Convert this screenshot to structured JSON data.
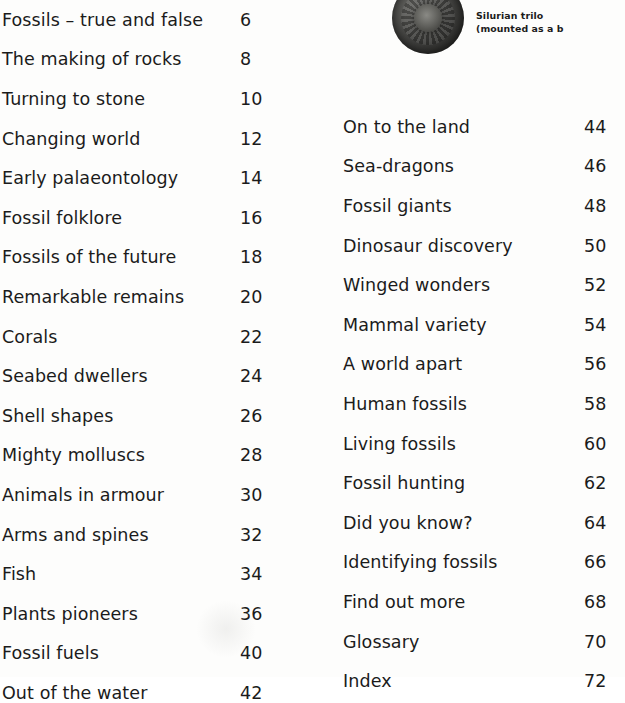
{
  "document": {
    "type": "table-of-contents"
  },
  "left_column": [
    {
      "title": "Fossils – true and false",
      "page": "6"
    },
    {
      "title": "The making of rocks",
      "page": "8"
    },
    {
      "title": "Turning to stone",
      "page": "10"
    },
    {
      "title": "Changing world",
      "page": "12"
    },
    {
      "title": "Early palaeontology",
      "page": "14"
    },
    {
      "title": "Fossil folklore",
      "page": "16"
    },
    {
      "title": "Fossils of the future",
      "page": "18"
    },
    {
      "title": "Remarkable remains",
      "page": "20"
    },
    {
      "title": "Corals",
      "page": "22"
    },
    {
      "title": "Seabed dwellers",
      "page": "24"
    },
    {
      "title": "Shell shapes",
      "page": "26"
    },
    {
      "title": "Mighty molluscs",
      "page": "28"
    },
    {
      "title": "Animals in armour",
      "page": "30"
    },
    {
      "title": "Arms and spines",
      "page": "32"
    },
    {
      "title": "Fish",
      "page": "34"
    },
    {
      "title": "Plants pioneers",
      "page": "36"
    },
    {
      "title": "Fossil fuels",
      "page": "40"
    },
    {
      "title": "Out of the water",
      "page": "42"
    }
  ],
  "right_column": [
    {
      "title": "On to the land",
      "page": "44"
    },
    {
      "title": "Sea-dragons",
      "page": "46"
    },
    {
      "title": "Fossil giants",
      "page": "48"
    },
    {
      "title": "Dinosaur discovery",
      "page": "50"
    },
    {
      "title": "Winged wonders",
      "page": "52"
    },
    {
      "title": "Mammal variety",
      "page": "54"
    },
    {
      "title": "A world apart",
      "page": "56"
    },
    {
      "title": "Human fossils",
      "page": "58"
    },
    {
      "title": "Living fossils",
      "page": "60"
    },
    {
      "title": "Fossil hunting",
      "page": "62"
    },
    {
      "title": "Did you know?",
      "page": "64"
    },
    {
      "title": "Identifying fossils",
      "page": "66"
    },
    {
      "title": "Find out more",
      "page": "68"
    },
    {
      "title": "Glossary",
      "page": "70"
    },
    {
      "title": "Index",
      "page": "72"
    }
  ],
  "figure": {
    "caption_line_1": "Silurian trilo",
    "caption_line_2": "(mounted as a b"
  }
}
